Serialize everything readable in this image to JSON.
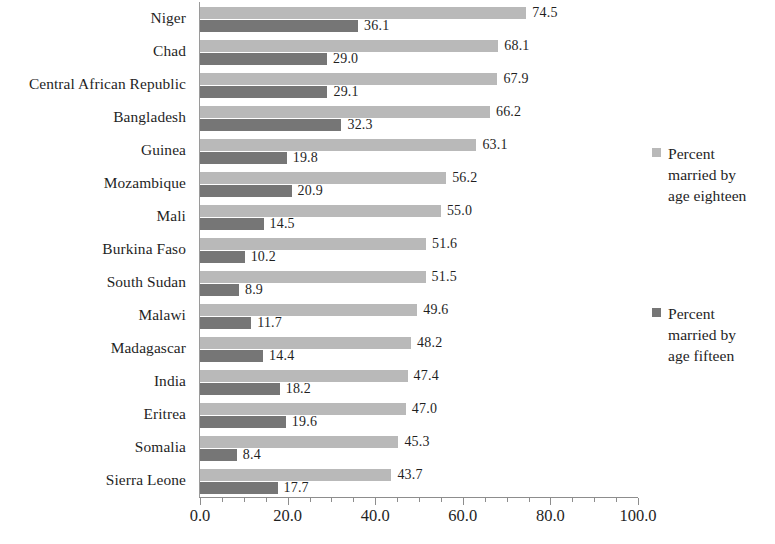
{
  "chart_data": {
    "type": "bar",
    "orientation": "horizontal",
    "title": "",
    "subtitle": "",
    "xlabel": "",
    "ylabel": "",
    "xlim": [
      0.0,
      100.0
    ],
    "xticks": [
      "0.0",
      "20.0",
      "40.0",
      "60.0",
      "80.0",
      "100.0"
    ],
    "xtick_values": [
      0.0,
      20.0,
      40.0,
      60.0,
      80.0,
      100.0
    ],
    "minor_tick_step": 5.0,
    "grid": false,
    "legend_position": "right",
    "categories": [
      "Niger",
      "Chad",
      "Central African Republic",
      "Bangladesh",
      "Guinea",
      "Mozambique",
      "Mali",
      "Burkina Faso",
      "South Sudan",
      "Malawi",
      "Madagascar",
      "India",
      "Eritrea",
      "Somalia",
      "Sierra Leone"
    ],
    "series": [
      {
        "name": "Percent married by age eighteen",
        "color": "#b9b9b9",
        "values": [
          74.5,
          68.1,
          67.9,
          66.2,
          63.1,
          56.2,
          55.0,
          51.6,
          51.5,
          49.6,
          48.2,
          47.4,
          47.0,
          45.3,
          43.7
        ],
        "labels": [
          "74.5",
          "68.1",
          "67.9",
          "66.2",
          "63.1",
          "56.2",
          "55.0",
          "51.6",
          "51.5",
          "49.6",
          "48.2",
          "47.4",
          "47.0",
          "45.3",
          "43.7"
        ]
      },
      {
        "name": "Percent married by age fifteen",
        "color": "#767676",
        "values": [
          36.1,
          29.0,
          29.1,
          32.3,
          19.8,
          20.9,
          14.5,
          10.2,
          8.9,
          11.7,
          14.4,
          18.2,
          19.6,
          8.4,
          17.7
        ],
        "labels": [
          "36.1",
          "29.0",
          "29.1",
          "32.3",
          "19.8",
          "20.9",
          "14.5",
          "10.2",
          "8.9",
          "11.7",
          "14.4",
          "18.2",
          "19.6",
          "8.4",
          "17.7"
        ]
      }
    ]
  },
  "legend": {
    "entries": [
      {
        "swatch": "light",
        "color": "#b9b9b9",
        "lines": [
          "Percent",
          "married by",
          "age eighteen"
        ]
      },
      {
        "swatch": "dark",
        "color": "#767676",
        "lines": [
          "Percent",
          "married by",
          "age fifteen"
        ]
      }
    ]
  }
}
